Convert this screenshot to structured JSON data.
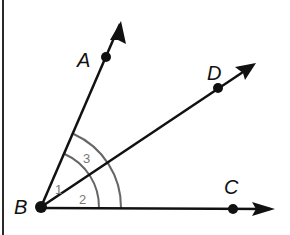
{
  "diagram": {
    "type": "geometry-angles",
    "vertex": {
      "label": "B",
      "x": 41,
      "y": 207
    },
    "rays": [
      {
        "name": "BA",
        "point_label": "A",
        "point": {
          "x": 106,
          "y": 57
        },
        "tip": {
          "x": 121,
          "y": 21
        },
        "label_pos": {
          "x": 78,
          "y": 67
        }
      },
      {
        "name": "BD",
        "point_label": "D",
        "point": {
          "x": 218,
          "y": 88
        },
        "tip": {
          "x": 256,
          "y": 63
        },
        "label_pos": {
          "x": 207,
          "y": 80
        }
      },
      {
        "name": "BC",
        "point_label": "C",
        "point": {
          "x": 233,
          "y": 209
        },
        "tip": {
          "x": 274,
          "y": 209
        },
        "label_pos": {
          "x": 224,
          "y": 193
        }
      }
    ],
    "angles": [
      {
        "label": "1",
        "between": [
          "BA",
          "BD"
        ],
        "x": 52,
        "y": 189
      },
      {
        "label": "2",
        "between": [
          "BD",
          "BC"
        ],
        "x": 77,
        "y": 203
      },
      {
        "label": "3",
        "between": [
          "BA",
          "BC"
        ],
        "x": 81,
        "y": 159
      }
    ],
    "arcs": [
      {
        "name": "inner-arc",
        "radius": 58,
        "color": "#666666"
      },
      {
        "name": "outer-arc",
        "radius": 80,
        "color": "#666666"
      }
    ],
    "colors": {
      "line": "#111111",
      "arc": "#666666",
      "angle_text": "#777777",
      "background": "#ffffff"
    }
  },
  "labels": {
    "A": "A",
    "B": "B",
    "C": "C",
    "D": "D",
    "angle1": "1",
    "angle2": "2",
    "angle3": "3"
  }
}
